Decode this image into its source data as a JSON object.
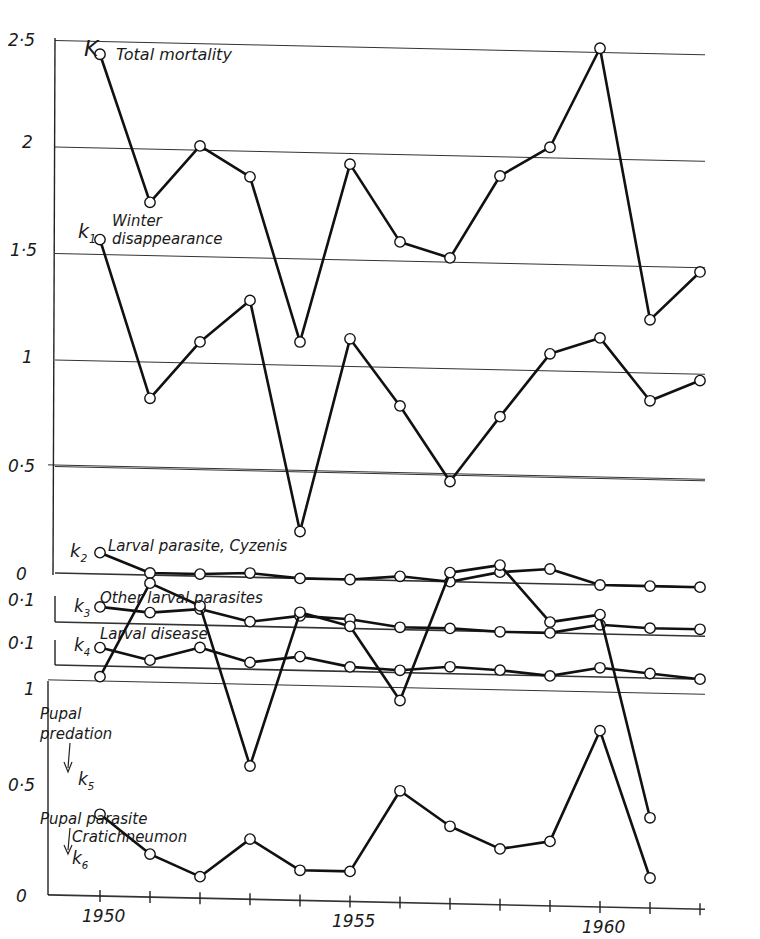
{
  "chart_data": {
    "type": "line",
    "title": "",
    "xlabel": "",
    "x": [
      1950,
      1951,
      1952,
      1953,
      1954,
      1955,
      1956,
      1957,
      1958,
      1959,
      1960,
      1961,
      1962
    ],
    "x_ticks": [
      "1950",
      "1955",
      "1960"
    ],
    "panels": [
      {
        "id": "top",
        "y_ticks": [
          "2·5",
          "2",
          "1·5",
          "1",
          "0·5",
          "0"
        ],
        "ylim": [
          0,
          2.5
        ],
        "series": [
          {
            "key": "K",
            "name": "Total mortality",
            "values": [
              2.44,
              1.75,
              2.02,
              1.88,
              1.11,
              1.95,
              1.59,
              1.52,
              1.91,
              2.05,
              2.52,
              1.25,
              1.48
            ]
          },
          {
            "key": "k1",
            "name": "Winter disappearance",
            "values": [
              1.57,
              0.83,
              1.1,
              1.3,
              0.22,
              1.13,
              0.82,
              0.47,
              0.78,
              1.08,
              1.16,
              0.87,
              0.97
            ]
          },
          {
            "key": "k2",
            "name": "Larval parasite, Cyzenis",
            "values": [
              0.1,
              0.01,
              0.01,
              0.02,
              0.0,
              0.0,
              0.02,
              0.0,
              0.05,
              0.07,
              0.0,
              0.0,
              0.0
            ]
          }
        ]
      },
      {
        "id": "k3",
        "y_ticks": [
          "0·1"
        ],
        "series": [
          {
            "key": "k3",
            "name": "Other larval parasites",
            "values": [
              0.07,
              0.05,
              0.07,
              0.02,
              0.05,
              0.04,
              0.01,
              0.01,
              0.0,
              0.0,
              0.04,
              0.03,
              0.03
            ]
          }
        ]
      },
      {
        "id": "k4",
        "y_ticks": [
          "0·1"
        ],
        "series": [
          {
            "key": "k4",
            "name": "Larval disease",
            "values": [
              0.08,
              0.03,
              0.09,
              0.03,
              0.06,
              0.02,
              0.01,
              0.03,
              0.02,
              0.0,
              0.04,
              0.02,
              0.0
            ]
          }
        ]
      },
      {
        "id": "bottom",
        "y_ticks": [
          "1",
          "0·5",
          "0"
        ],
        "ylim": [
          0,
          1
        ],
        "series": [
          {
            "key": "k5",
            "name": "Pupal predation",
            "values": [
              0.51,
              0.73,
              0.68,
              0.31,
              0.67,
              0.64,
              0.47,
              0.77,
              0.79,
              0.66,
              0.68,
              0.21
            ]
          },
          {
            "key": "k6",
            "name": "Pupal parasite Cratichneumon",
            "values": [
              0.19,
              0.1,
              0.05,
              0.14,
              0.07,
              0.07,
              0.26,
              0.18,
              0.13,
              0.15,
              0.41,
              0.07
            ]
          }
        ]
      }
    ],
    "labels": {
      "K": {
        "sym": "K",
        "text": "Total mortality"
      },
      "k1": {
        "sym": "k",
        "sub": "1",
        "text1": "Winter",
        "text2": "disappearance"
      },
      "k2": {
        "sym": "k",
        "sub": "2",
        "text": "Larval parasite, Cyzenis"
      },
      "k3": {
        "sym": "k",
        "sub": "3",
        "text": "Other larval parasites"
      },
      "k4": {
        "sym": "k",
        "sub": "4",
        "text": "Larval disease"
      },
      "k5": {
        "sym": "k",
        "sub": "5",
        "text1": "Pupal",
        "text2": "predation"
      },
      "k6": {
        "sym": "k",
        "sub": "6",
        "text1": "Pupal parasite",
        "text2": "Cratichneumon"
      }
    }
  }
}
